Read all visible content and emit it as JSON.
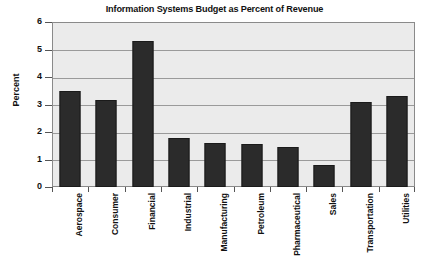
{
  "chart_data": {
    "type": "bar",
    "title": "Information Systems Budget as Percent of Revenue",
    "xlabel": "",
    "ylabel": "Percent",
    "ylim": [
      0,
      6
    ],
    "ytick_step": 1,
    "yticks": [
      "0",
      "1",
      "2",
      "3",
      "4",
      "5",
      "6"
    ],
    "grid": true,
    "legend": false,
    "categories": [
      "Aerospace",
      "Consumer",
      "Financial",
      "Industrial",
      "Manufacturing",
      "Petroleum",
      "Pharmaceutical",
      "Sales",
      "Transportation",
      "Utilities"
    ],
    "values": [
      3.5,
      3.15,
      5.3,
      1.8,
      1.6,
      1.55,
      1.45,
      0.8,
      3.1,
      3.3
    ],
    "series": [
      {
        "name": "Percent of Revenue",
        "values": [
          3.5,
          3.15,
          5.3,
          1.8,
          1.6,
          1.55,
          1.45,
          0.8,
          3.1,
          3.3
        ]
      }
    ],
    "colors": {
      "bar_fill": "#2b2b2b",
      "bar_stroke": "#1a1a1a",
      "plot_background": "#ebebeb",
      "gridline": "#9a9a9a",
      "axis": "#8a8a8a",
      "text": "#111111",
      "page_background": "#ffffff"
    }
  }
}
